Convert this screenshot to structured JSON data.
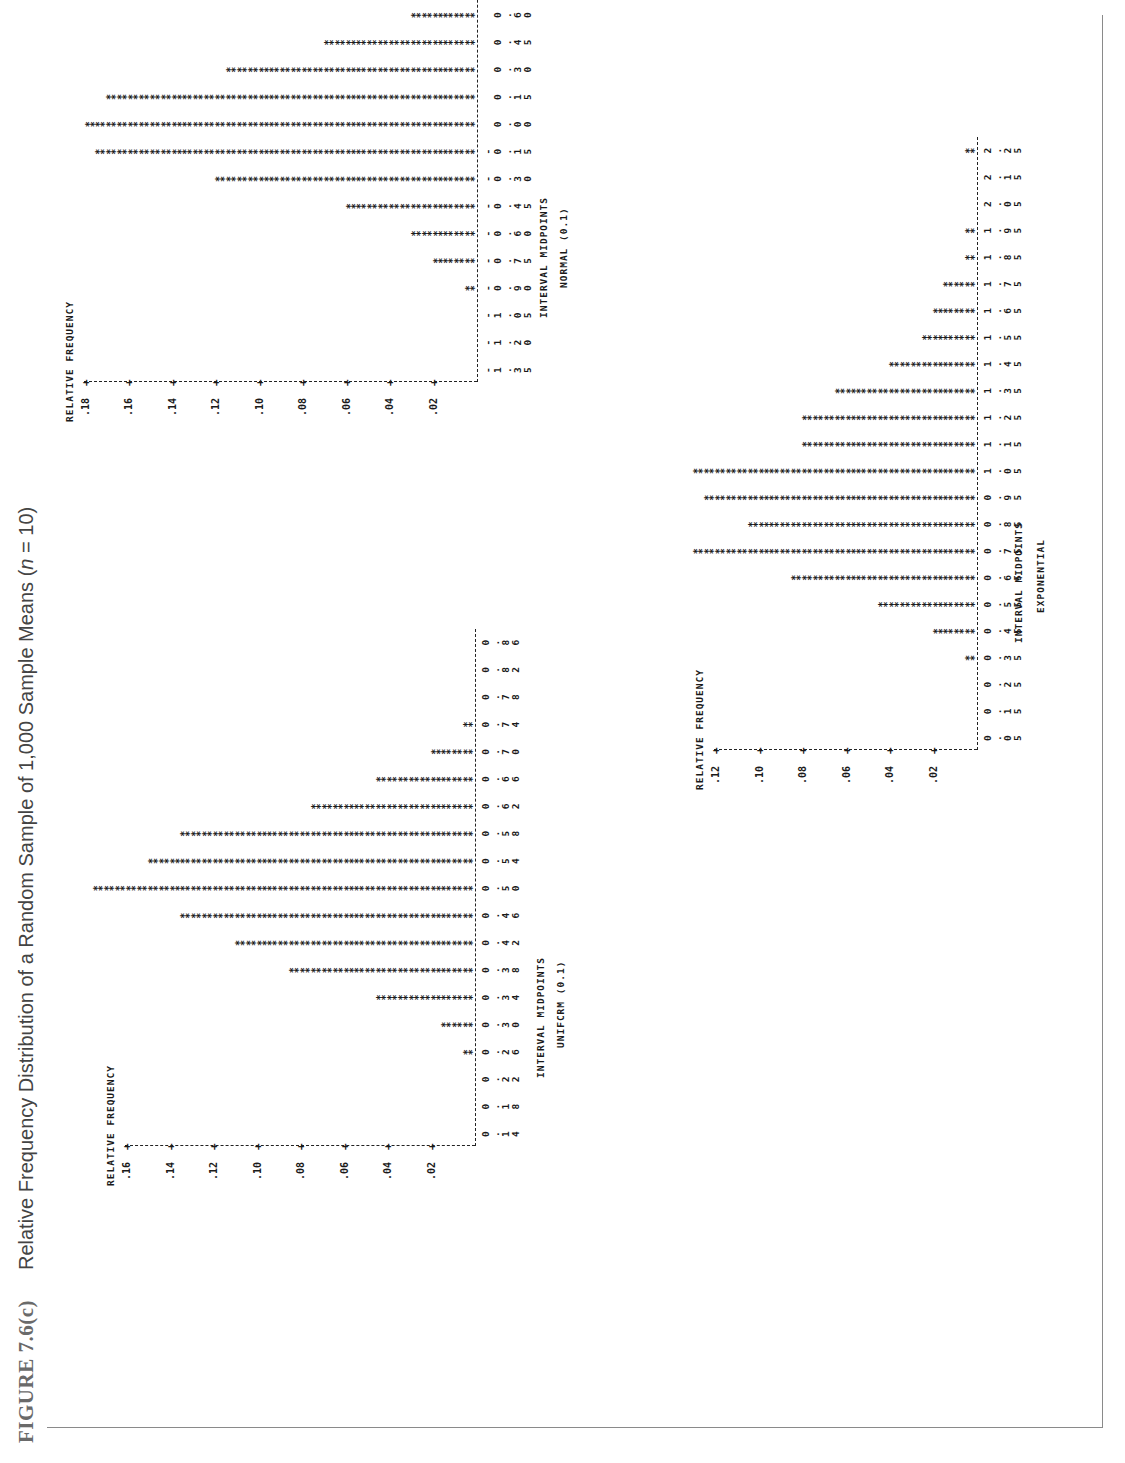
{
  "caption": {
    "figure_number": "FIGURE 7.6(c)",
    "title_prefix": "Relative Frequency Distribution of a Random Sample of 1,000 Sample Means (",
    "title_var": "n",
    "title_suffix": " = 10)"
  },
  "chart_data": [
    {
      "type": "bar",
      "title": "UNIFORM (0,1)",
      "printed_title": "UNIFCRM (0.1)",
      "xlabel": "INTERVAL MIDPOINTS",
      "ylabel": "RELATIVE FREQUENCY",
      "yticks": [
        ".02",
        ".04",
        ".06",
        ".08",
        ".10",
        ".12",
        ".14",
        ".16"
      ],
      "ylim": [
        0,
        0.18
      ],
      "unit_per_symbol": 0.005,
      "categories": [
        "0.14",
        "0.18",
        "0.22",
        "0.26",
        "0.30",
        "0.34",
        "0.38",
        "0.42",
        "0.46",
        "0.50",
        "0.54",
        "0.58",
        "0.62",
        "0.66",
        "0.70",
        "0.74",
        "0.78",
        "0.82",
        "0.86"
      ],
      "bin_labels": [
        [
          "0",
          ".",
          "1",
          "4"
        ],
        [
          "0",
          ".",
          "1",
          "8"
        ],
        [
          "0",
          ".",
          "2",
          "2"
        ],
        [
          "0",
          ".",
          "2",
          "6"
        ],
        [
          "0",
          ".",
          "3",
          "0"
        ],
        [
          "0",
          ".",
          "3",
          "4"
        ],
        [
          "0",
          ".",
          "3",
          "8"
        ],
        [
          "0",
          ".",
          "4",
          "2"
        ],
        [
          "0",
          ".",
          "4",
          "6"
        ],
        [
          "0",
          ".",
          "5",
          "0"
        ],
        [
          "0",
          ".",
          "5",
          "4"
        ],
        [
          "0",
          ".",
          "5",
          "8"
        ],
        [
          "0",
          ".",
          "6",
          "2"
        ],
        [
          "0",
          ".",
          "6",
          "6"
        ],
        [
          "0",
          ".",
          "7",
          "0"
        ],
        [
          "0",
          ".",
          "7",
          "4"
        ],
        [
          "0",
          ".",
          "7",
          "8"
        ],
        [
          "0",
          ".",
          "8",
          "2"
        ],
        [
          "0",
          ".",
          "8",
          "6"
        ]
      ],
      "values": [
        0,
        0,
        0,
        0.005,
        0.015,
        0.045,
        0.085,
        0.11,
        0.135,
        0.175,
        0.15,
        0.135,
        0.075,
        0.045,
        0.02,
        0.005,
        0,
        0,
        0
      ],
      "grid": false,
      "orientation": "rotated 90° (page landscape)"
    },
    {
      "type": "bar",
      "title": "NORMAL (0,1)",
      "printed_title": "NORMAL (0.1)",
      "xlabel": "INTERVAL MIDPOINTS",
      "ylabel": "RELATIVE FREQUENCY",
      "yticks": [
        ".02",
        ".04",
        ".06",
        ".08",
        ".10",
        ".12",
        ".14",
        ".16",
        ".18"
      ],
      "ylim": [
        0,
        0.18
      ],
      "unit_per_symbol": 0.005,
      "categories": [
        "-1.35",
        "-1.20",
        "-1.05",
        "-0.90",
        "-0.75",
        "-0.60",
        "-0.45",
        "-0.30",
        "-0.15",
        "0.00",
        "0.15",
        "0.30",
        "0.45",
        "0.60",
        "0.75",
        "0.90",
        "1.05",
        "1.20",
        "1.35"
      ],
      "bin_labels": [
        [
          "-",
          "1",
          ".",
          "3",
          "5"
        ],
        [
          "-",
          "1",
          ".",
          "2",
          "0"
        ],
        [
          "-",
          "1",
          ".",
          "0",
          "5"
        ],
        [
          "-",
          "0",
          ".",
          "9",
          "0"
        ],
        [
          "-",
          "0",
          ".",
          "7",
          "5"
        ],
        [
          "-",
          "0",
          ".",
          "6",
          "0"
        ],
        [
          "-",
          "0",
          ".",
          "4",
          "5"
        ],
        [
          "-",
          "0",
          ".",
          "3",
          "0"
        ],
        [
          "-",
          "0",
          ".",
          "1",
          "5"
        ],
        [
          "",
          "0",
          ".",
          "0",
          "0"
        ],
        [
          "",
          "0",
          ".",
          "1",
          "5"
        ],
        [
          "",
          "0",
          ".",
          "3",
          "0"
        ],
        [
          "",
          "0",
          ".",
          "4",
          "5"
        ],
        [
          "",
          "0",
          ".",
          "6",
          "0"
        ],
        [
          "",
          "0",
          ".",
          "7",
          "5"
        ],
        [
          "",
          "0",
          ".",
          "9",
          "0"
        ],
        [
          "",
          "1",
          ".",
          "0",
          "5"
        ],
        [
          "",
          "1",
          ".",
          "2",
          "0"
        ],
        [
          "",
          "1",
          ".",
          "3",
          "5"
        ]
      ],
      "values": [
        0,
        0,
        0,
        0.005,
        0.02,
        0.03,
        0.06,
        0.12,
        0.175,
        0.18,
        0.17,
        0.115,
        0.07,
        0.03,
        0.02,
        0.005,
        0.005,
        0,
        0
      ],
      "grid": false,
      "orientation": "rotated 90° (page landscape)"
    },
    {
      "type": "bar",
      "title": "EXPONENTIAL",
      "xlabel": "INTERVAL MIDPOINTS",
      "ylabel": "RELATIVE FREQUENCY",
      "yticks": [
        ".02",
        ".04",
        ".06",
        ".08",
        ".10",
        ".12"
      ],
      "ylim": [
        0,
        0.13
      ],
      "unit_per_symbol": 0.005,
      "categories": [
        "0.05",
        "0.15",
        "0.25",
        "0.35",
        "0.45",
        "0.55",
        "0.65",
        "0.75",
        "0.85",
        "0.95",
        "1.05",
        "1.15",
        "1.25",
        "1.35",
        "1.45",
        "1.55",
        "1.65",
        "1.75",
        "1.85",
        "1.95",
        "2.05",
        "2.15",
        "2.25"
      ],
      "bin_labels": [
        [
          "0",
          ".",
          "0",
          "5"
        ],
        [
          "0",
          ".",
          "1",
          "5"
        ],
        [
          "0",
          ".",
          "2",
          "5"
        ],
        [
          "0",
          ".",
          "3",
          "5"
        ],
        [
          "0",
          ".",
          "4",
          "5"
        ],
        [
          "0",
          ".",
          "5",
          "5"
        ],
        [
          "0",
          ".",
          "6",
          "5"
        ],
        [
          "0",
          ".",
          "7",
          "5"
        ],
        [
          "0",
          ".",
          "8",
          "5"
        ],
        [
          "0",
          ".",
          "9",
          "5"
        ],
        [
          "1",
          ".",
          "0",
          "5"
        ],
        [
          "1",
          ".",
          "1",
          "5"
        ],
        [
          "1",
          ".",
          "2",
          "5"
        ],
        [
          "1",
          ".",
          "3",
          "5"
        ],
        [
          "1",
          ".",
          "4",
          "5"
        ],
        [
          "1",
          ".",
          "5",
          "5"
        ],
        [
          "1",
          ".",
          "6",
          "5"
        ],
        [
          "1",
          ".",
          "7",
          "5"
        ],
        [
          "1",
          ".",
          "8",
          "5"
        ],
        [
          "1",
          ".",
          "9",
          "5"
        ],
        [
          "2",
          ".",
          "0",
          "5"
        ],
        [
          "2",
          ".",
          "1",
          "5"
        ],
        [
          "2",
          ".",
          "2",
          "5"
        ]
      ],
      "values": [
        0,
        0,
        0,
        0.005,
        0.02,
        0.045,
        0.085,
        0.13,
        0.105,
        0.125,
        0.13,
        0.08,
        0.08,
        0.065,
        0.04,
        0.025,
        0.02,
        0.015,
        0.005,
        0.005,
        0,
        0,
        0.005
      ],
      "grid": false,
      "orientation": "rotated 90° (page landscape)"
    }
  ],
  "layout": {
    "charts": [
      {
        "key": "uniform",
        "axis_y": 475,
        "top_y": 60,
        "first_bin_x": 329,
        "bin_step": 27.3,
        "ylab_x": 330,
        "title_y": 535,
        "title_cx": 455,
        "subtitle_y": 555,
        "ytick_step": 43.5,
        "ytick_labels_top": 488
      },
      {
        "key": "normal",
        "axis_y": 477,
        "top_y": 60,
        "first_bin_x": 1093,
        "bin_step": 27.3,
        "ylab_x": 1080,
        "title_y": 538,
        "title_cx": 1215,
        "subtitle_y": 558,
        "ytick_step": 43.5,
        "ytick_labels_top": 490
      },
      {
        "key": "exponential",
        "axis_y": 977,
        "top_y": 665,
        "first_bin_x": 725,
        "bin_step": 26.7,
        "ylab_x": 740,
        "title_y": 1013,
        "title_cx": 890,
        "subtitle_y": 1035,
        "ytick_step": 43.5,
        "ytick_labels_top": 990
      }
    ]
  }
}
